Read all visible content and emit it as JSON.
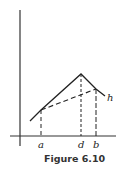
{
  "figure": {
    "caption": "Figure 6.10",
    "labels": {
      "a": "a",
      "d": "d",
      "b": "b",
      "h": "h"
    },
    "colors": {
      "line": "#222222",
      "background": "#ffffff"
    }
  },
  "diagram": {
    "axes": {
      "vertical": {
        "x": 20,
        "y1": 10,
        "y2": 146
      },
      "horizontal": {
        "y": 136,
        "x1": 10,
        "x2": 116
      }
    },
    "solid_polyline": [
      [
        30,
        121
      ],
      [
        41,
        110
      ],
      [
        81,
        74
      ],
      [
        96,
        89
      ],
      [
        105,
        96
      ]
    ],
    "dashed_chord": [
      [
        41,
        110
      ],
      [
        96,
        89
      ]
    ],
    "dashed_verticals": [
      {
        "label": "a",
        "x": 41,
        "y_top": 110
      },
      {
        "label": "d",
        "x": 81,
        "y_top": 74
      },
      {
        "label": "b",
        "x": 96,
        "y_top": 89
      }
    ]
  }
}
